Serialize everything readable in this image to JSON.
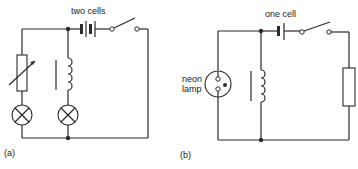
{
  "diagram_a": {
    "label": "(a)",
    "battery_label": "two cells",
    "components": [
      "variable-resistor",
      "lamp",
      "lamp",
      "inductor-with-core",
      "battery-two-cells",
      "switch"
    ]
  },
  "diagram_b": {
    "label": "(b)",
    "battery_label": "one cell",
    "neon_label_line1": "neon",
    "neon_label_line2": "lamp",
    "components": [
      "neon-lamp",
      "inductor-with-core",
      "battery-one-cell",
      "switch",
      "resistor"
    ]
  },
  "colors": {
    "line": "#2a2a2a",
    "background": "#ffffff"
  }
}
